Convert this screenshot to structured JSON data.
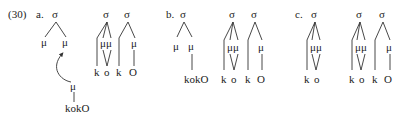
{
  "example_number": "(30)",
  "panels": [
    {
      "label": "a.",
      "trees": [
        {
          "root": "σ",
          "moras": [
            "μ",
            "μ"
          ]
        },
        {
          "root": "σ",
          "moras": [
            "μμ"
          ],
          "segments": [
            "k",
            "o"
          ]
        },
        {
          "root": "σ",
          "moras": [
            "μ"
          ],
          "segments": [
            "k",
            "O"
          ]
        }
      ],
      "floating": {
        "mora": "μ",
        "string": "kokO",
        "arrow": "curved arrow from floating μ to second μ"
      }
    },
    {
      "label": "b.",
      "trees": [
        {
          "root": "σ",
          "moras": [
            "μ",
            "μ"
          ],
          "string": "kokO"
        },
        {
          "root": "σ",
          "moras": [
            "μμ"
          ],
          "segments": [
            "k",
            "o"
          ]
        },
        {
          "root": "σ",
          "moras": [
            "μ"
          ],
          "segments": [
            "k",
            "O"
          ]
        }
      ]
    },
    {
      "label": "c.",
      "trees": [
        {
          "root": "σ",
          "moras": [
            "μμ"
          ],
          "segments": [
            "k",
            "o"
          ]
        },
        {
          "root": "σ",
          "moras": [
            "μμ"
          ],
          "segments": [
            "k",
            "o"
          ]
        },
        {
          "root": "σ",
          "moras": [
            "μ"
          ],
          "segments": [
            "k",
            "O"
          ]
        }
      ]
    }
  ],
  "symbols": {
    "sigma": "σ",
    "mu": "μ"
  }
}
